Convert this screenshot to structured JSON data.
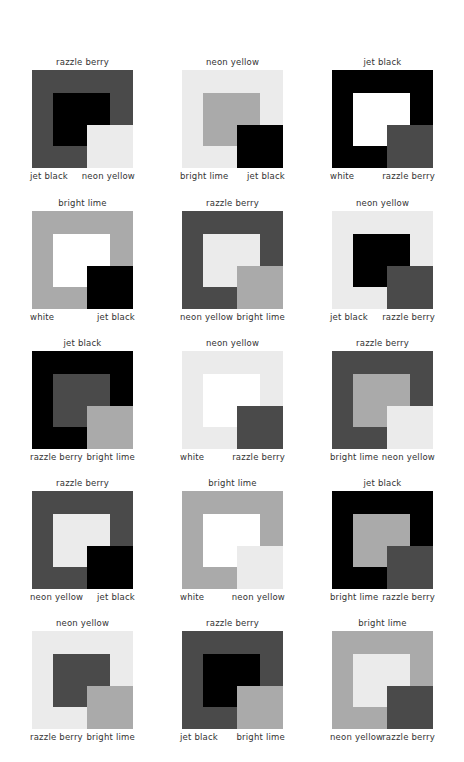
{
  "palette": {
    "razzle berry": "#4a4a4a",
    "neon yellow": "#ebebeb",
    "jet black": "#000000",
    "white": "#ffffff",
    "bright lime": "#aaaaaa"
  },
  "layout": {
    "col_x": [
      32,
      182,
      332
    ],
    "row_y": [
      70,
      211,
      351,
      491,
      631
    ]
  },
  "cells": [
    {
      "outer": "razzle berry",
      "inner": "jet black",
      "corner": "neon yellow",
      "left_label": "jet black",
      "right_label": "neon yellow"
    },
    {
      "outer": "neon yellow",
      "inner": "bright lime",
      "corner": "jet black",
      "left_label": "bright lime",
      "right_label": "jet black"
    },
    {
      "outer": "jet black",
      "inner": "white",
      "corner": "razzle berry",
      "left_label": "white",
      "right_label": "razzle berry"
    },
    {
      "outer": "bright lime",
      "inner": "white",
      "corner": "jet black",
      "left_label": "white",
      "right_label": "jet black"
    },
    {
      "outer": "razzle berry",
      "inner": "neon yellow",
      "corner": "bright lime",
      "left_label": "neon yellow",
      "right_label": "bright lime"
    },
    {
      "outer": "neon yellow",
      "inner": "jet black",
      "corner": "razzle berry",
      "left_label": "jet black",
      "right_label": "razzle berry"
    },
    {
      "outer": "jet black",
      "inner": "razzle berry",
      "corner": "bright lime",
      "left_label": "razzle berry",
      "right_label": "bright lime"
    },
    {
      "outer": "neon yellow",
      "inner": "white",
      "corner": "razzle berry",
      "left_label": "white",
      "right_label": "razzle berry"
    },
    {
      "outer": "razzle berry",
      "inner": "bright lime",
      "corner": "neon yellow",
      "left_label": "bright lime",
      "right_label": "neon yellow"
    },
    {
      "outer": "razzle berry",
      "inner": "neon yellow",
      "corner": "jet black",
      "left_label": "neon yellow",
      "right_label": "jet black"
    },
    {
      "outer": "bright lime",
      "inner": "white",
      "corner": "neon yellow",
      "left_label": "white",
      "right_label": "neon yellow"
    },
    {
      "outer": "jet black",
      "inner": "bright lime",
      "corner": "razzle berry",
      "left_label": "bright lime",
      "right_label": "razzle berry"
    },
    {
      "outer": "neon yellow",
      "inner": "razzle berry",
      "corner": "bright lime",
      "left_label": "razzle berry",
      "right_label": "bright lime"
    },
    {
      "outer": "razzle berry",
      "inner": "jet black",
      "corner": "bright lime",
      "left_label": "jet black",
      "right_label": "bright lime"
    },
    {
      "outer": "bright lime",
      "inner": "neon yellow",
      "corner": "razzle berry",
      "left_label": "neon yellow",
      "right_label": "razzle berry"
    }
  ]
}
